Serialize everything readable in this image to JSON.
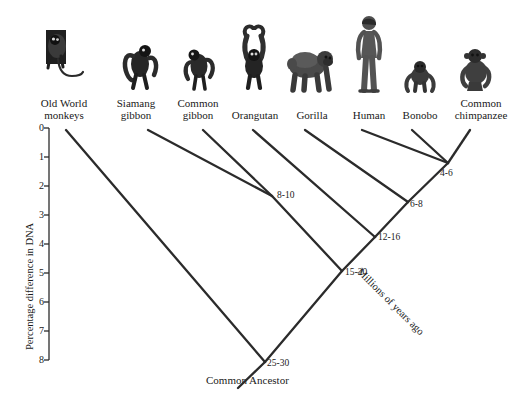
{
  "figure": {
    "kind": "phylogenetic-tree",
    "root_label": "Common Ancestor",
    "line_color": "#2b2b2b",
    "background": "#ffffff"
  },
  "y_axis": {
    "title": "Percentage difference in DNA",
    "ticks": [
      "0",
      "1",
      "2",
      "3",
      "4",
      "5",
      "6",
      "7",
      "8"
    ],
    "min": 0,
    "max": 8
  },
  "diagonal_axis": {
    "title": "Millions of years ago"
  },
  "tips": [
    {
      "label_line1": "Old World",
      "label_line2": "monkeys",
      "icon": "old-world-monkey-icon"
    },
    {
      "label_line1": "Siamang",
      "label_line2": "gibbon",
      "icon": "siamang-gibbon-icon"
    },
    {
      "label_line1": "Common",
      "label_line2": "gibbon",
      "icon": "common-gibbon-icon"
    },
    {
      "label_line1": "Orangutan",
      "label_line2": "",
      "icon": "orangutan-icon"
    },
    {
      "label_line1": "Gorilla",
      "label_line2": "",
      "icon": "gorilla-icon"
    },
    {
      "label_line1": "Human",
      "label_line2": "",
      "icon": "human-icon"
    },
    {
      "label_line1": "Bonobo",
      "label_line2": "",
      "icon": "bonobo-icon"
    },
    {
      "label_line1": "Common",
      "label_line2": "chimpanzee",
      "icon": "common-chimpanzee-icon"
    }
  ],
  "nodes": [
    {
      "name": "gibbon-split",
      "label": "8-10"
    },
    {
      "name": "chimp-bonobo-split",
      "label": "4-6"
    },
    {
      "name": "human-pan-split",
      "label": "6-8"
    },
    {
      "name": "gorilla-split",
      "label": "12-16"
    },
    {
      "name": "orangutan-split",
      "label": "15-20"
    },
    {
      "name": "root-split",
      "label": "25-30"
    }
  ]
}
